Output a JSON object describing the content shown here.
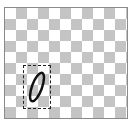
{
  "canvas": {
    "background": "transparent-checkerboard",
    "checker_color": "#c4c4c4",
    "border_color": "#8a8a8a"
  },
  "selection": {
    "style": "dashed",
    "shape": {
      "type": "ellipse",
      "stroke_color": "#111111",
      "rotation_deg": 20
    }
  }
}
